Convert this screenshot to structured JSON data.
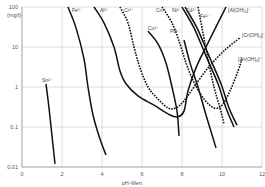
{
  "chart_data": {
    "type": "line",
    "title": "",
    "xlabel": "pH-Wert",
    "ylabel": "(mg/l)",
    "xlim": [
      0,
      12
    ],
    "ylim": [
      0.01,
      100
    ],
    "yscale": "log",
    "grid": true,
    "x_ticks": [
      "0",
      "2",
      "4",
      "6",
      "8",
      "10",
      "12"
    ],
    "y_ticks": [
      "100",
      "10",
      "1",
      "0.1",
      "0.01"
    ],
    "series": [
      {
        "name": "Sn2+",
        "label": "Sn²⁺",
        "style": "solid",
        "points": [
          [
            1.2,
            1.2
          ],
          [
            1.35,
            0.3
          ],
          [
            1.5,
            0.06
          ],
          [
            1.65,
            0.012
          ]
        ]
      },
      {
        "name": "Fe3+",
        "label": "Fe³⁺",
        "style": "solid",
        "points": [
          [
            2.3,
            100
          ],
          [
            2.7,
            30
          ],
          [
            3.1,
            5
          ],
          [
            3.3,
            1
          ],
          [
            3.55,
            0.2
          ],
          [
            3.9,
            0.05
          ],
          [
            4.2,
            0.02
          ]
        ]
      },
      {
        "name": "Al3+ / Al(OH)4-",
        "label": "Al³⁺",
        "style": "solid",
        "points": [
          [
            3.6,
            100
          ],
          [
            4.1,
            40
          ],
          [
            4.6,
            10
          ],
          [
            4.9,
            2.5
          ],
          [
            5.2,
            1.2
          ],
          [
            5.8,
            0.6
          ],
          [
            6.6,
            0.35
          ],
          [
            7.4,
            0.2
          ],
          [
            7.8,
            0.18
          ],
          [
            8.1,
            0.25
          ],
          [
            8.3,
            0.8
          ],
          [
            8.7,
            3
          ],
          [
            9.2,
            10
          ],
          [
            9.8,
            40
          ],
          [
            10.2,
            100
          ]
        ]
      },
      {
        "name": "Cr3+ / Cr(OH)4-",
        "label": "Cr³⁺",
        "style": "dotted",
        "points": [
          [
            4.9,
            100
          ],
          [
            5.3,
            40
          ],
          [
            5.6,
            10
          ],
          [
            5.9,
            3
          ],
          [
            6.3,
            1
          ],
          [
            6.8,
            0.5
          ],
          [
            7.3,
            0.3
          ],
          [
            7.7,
            0.3
          ],
          [
            8.1,
            0.45
          ],
          [
            8.6,
            1
          ],
          [
            9.3,
            3
          ],
          [
            10.1,
            8
          ],
          [
            10.9,
            17
          ]
        ]
      },
      {
        "name": "Cu2+",
        "label": "Cu²⁺",
        "style": "solid",
        "points": [
          [
            6.3,
            25
          ],
          [
            6.8,
            12
          ],
          [
            7.2,
            4
          ],
          [
            7.5,
            1
          ],
          [
            7.75,
            0.25
          ],
          [
            7.85,
            0.06
          ]
        ]
      },
      {
        "name": "Zn2+ / Zn(OH)4-",
        "label": "Cn²⁺",
        "style": "dotted",
        "points": [
          [
            7.0,
            100
          ],
          [
            7.5,
            40
          ],
          [
            7.9,
            12
          ],
          [
            8.2,
            4
          ],
          [
            8.6,
            1.3
          ],
          [
            9.1,
            0.5
          ],
          [
            9.6,
            0.3
          ],
          [
            10.0,
            0.35
          ],
          [
            10.4,
            0.8
          ],
          [
            10.8,
            2.5
          ],
          [
            11.0,
            5
          ]
        ]
      },
      {
        "name": "Pb2+",
        "label": "Pb²⁺",
        "style": "solid",
        "points": [
          [
            8.1,
            15
          ],
          [
            8.4,
            4
          ],
          [
            8.8,
            1
          ],
          [
            9.2,
            0.2
          ],
          [
            9.7,
            0.03
          ]
        ]
      },
      {
        "name": "Ni2+",
        "label": "Ni²⁺",
        "style": "solid",
        "points": [
          [
            8.0,
            100
          ],
          [
            8.6,
            30
          ],
          [
            9.2,
            6
          ],
          [
            9.8,
            1.2
          ],
          [
            10.2,
            0.3
          ],
          [
            10.6,
            0.1
          ]
        ]
      },
      {
        "name": "Cd2+",
        "label": "Cd²⁺",
        "style": "solid",
        "points": [
          [
            8.15,
            100
          ],
          [
            8.75,
            30
          ],
          [
            9.35,
            6
          ],
          [
            9.95,
            1.2
          ],
          [
            10.35,
            0.3
          ],
          [
            10.75,
            0.11
          ]
        ]
      },
      {
        "name": "Fe2+",
        "label": "Fe²⁺",
        "style": "dotted",
        "points": [
          [
            8.8,
            100
          ],
          [
            9.0,
            30
          ],
          [
            9.3,
            5
          ],
          [
            9.6,
            1
          ],
          [
            9.9,
            0.3
          ],
          [
            10.1,
            0.12
          ]
        ]
      }
    ],
    "annotations": [
      {
        "text": "Sn²⁺",
        "x": 1.0,
        "y": 1.5
      },
      {
        "text": "Fe³⁺",
        "x": 2.5,
        "y": 100
      },
      {
        "text": "Al³⁺",
        "x": 3.9,
        "y": 100
      },
      {
        "text": "Cr³⁺",
        "x": 5.1,
        "y": 100
      },
      {
        "text": "Cn²⁺",
        "x": 6.7,
        "y": 100
      },
      {
        "text": "Ni²⁺",
        "x": 7.5,
        "y": 100
      },
      {
        "text": "Cd²⁺",
        "x": 8.2,
        "y": 100
      },
      {
        "text": "Fe²⁺",
        "x": 8.9,
        "y": 60
      },
      {
        "text": "Pb²⁺",
        "x": 7.4,
        "y": 25
      },
      {
        "text": "Cu²⁺",
        "x": 6.3,
        "y": 30
      },
      {
        "text": "[Al(OH)₄]⁻",
        "x": 10.3,
        "y": 100
      },
      {
        "text": "[Cr(OH)₄]⁻",
        "x": 11.0,
        "y": 20
      },
      {
        "text": "[Zn(OH)₄]⁻",
        "x": 10.8,
        "y": 5
      }
    ]
  }
}
